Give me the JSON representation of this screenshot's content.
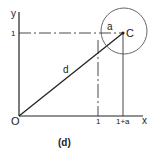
{
  "diagram": {
    "caption": "(d)",
    "labels": {
      "y_axis": "y",
      "x_axis": "x",
      "origin": "O",
      "y_tick": "1",
      "x_tick_1": "1",
      "x_tick_2": "1+a",
      "point": "C",
      "radius": "a",
      "distance": "d"
    },
    "colors": {
      "line": "#222222",
      "circle": "#555555",
      "background": "#ffffff"
    }
  }
}
